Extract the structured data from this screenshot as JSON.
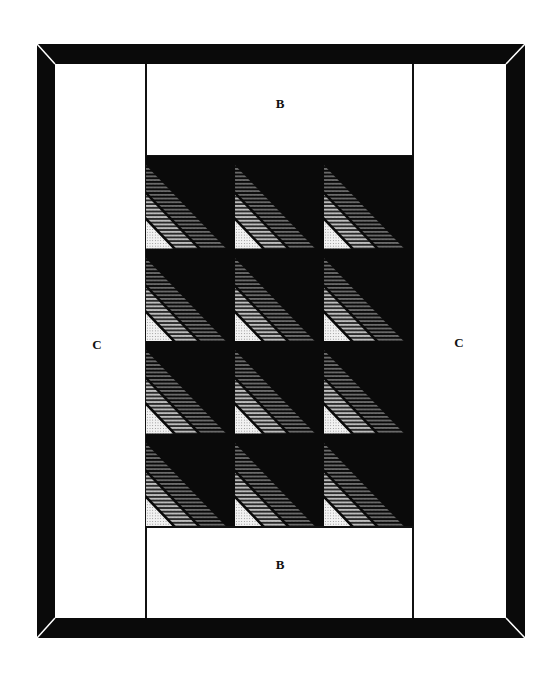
{
  "diagram": {
    "type": "quilt-layout",
    "border": {
      "color": "#0a0a0a",
      "miter_line_color": "#ffffff"
    },
    "labels": {
      "top": "B",
      "bottom": "B",
      "left": "C",
      "right": "C"
    },
    "center": {
      "rows": 4,
      "columns": 3,
      "block_pattern": "half-square triangle: black upper-right, striped lower-left",
      "colors": {
        "dark": "#0a0a0a",
        "mid": "#7a7a7a",
        "light": "#d8d8d8",
        "white": "#f4f4f4"
      }
    }
  }
}
